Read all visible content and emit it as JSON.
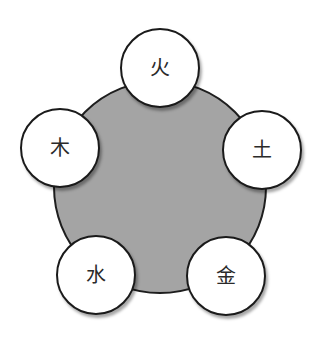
{
  "diagram": {
    "hub_color": "#a4a4a4",
    "nodes": [
      {
        "id": "fire",
        "label": "火",
        "cx": 160,
        "cy": 68
      },
      {
        "id": "earth",
        "label": "土",
        "cx": 262,
        "cy": 150
      },
      {
        "id": "metal",
        "label": "金",
        "cx": 226,
        "cy": 276
      },
      {
        "id": "water",
        "label": "水",
        "cx": 96,
        "cy": 275
      },
      {
        "id": "wood",
        "label": "木",
        "cx": 60,
        "cy": 148
      }
    ]
  }
}
